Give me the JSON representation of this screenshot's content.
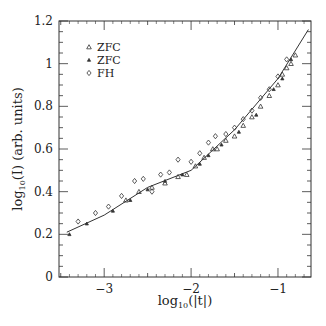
{
  "chart_data": {
    "type": "scatter",
    "title": "",
    "xlabel": "log10(|t|)",
    "ylabel": "log10(I) (arb. units)",
    "xlim": [
      -3.52,
      -0.62
    ],
    "ylim": [
      0,
      1.2
    ],
    "xticks": [
      -3,
      -2,
      -1
    ],
    "xtick_labels": [
      "−3",
      "−2",
      "−1"
    ],
    "yticks": [
      0,
      0.2,
      0.4,
      0.6,
      0.8,
      1.0,
      1.2
    ],
    "ytick_labels": [
      "0",
      "0.2",
      "0.4",
      "0.6",
      "0.8",
      "1",
      "1.2"
    ],
    "grid": false,
    "legend_position": "upper left",
    "legend": [
      {
        "label": "ZFC",
        "marker": "open-triangle"
      },
      {
        "label": "ZFC",
        "marker": "small-triangle"
      },
      {
        "label": "FH",
        "marker": "open-diamond"
      }
    ],
    "fit_line": {
      "x": [
        -3.43,
        -3.0,
        -2.5,
        -2.0,
        -1.5,
        -1.0,
        -0.65
      ],
      "y": [
        0.21,
        0.29,
        0.42,
        0.5,
        0.69,
        0.93,
        1.16
      ]
    },
    "series": [
      {
        "name": "ZFC (open triangles)",
        "x": [
          -2.75,
          -2.6,
          -2.45,
          -2.3,
          -2.15,
          -2.05,
          -1.95,
          -1.85,
          -1.75,
          -1.7,
          -1.6,
          -1.5,
          -1.4,
          -1.3,
          -1.2,
          -1.1,
          -1.0,
          -0.95,
          -0.9,
          -0.85,
          -0.8
        ],
        "y": [
          0.36,
          0.4,
          0.42,
          0.44,
          0.47,
          0.48,
          0.52,
          0.56,
          0.6,
          0.6,
          0.64,
          0.66,
          0.71,
          0.75,
          0.8,
          0.85,
          0.9,
          0.95,
          0.98,
          1.0,
          1.04
        ]
      },
      {
        "name": "ZFC (small triangles)",
        "x": [
          -3.4,
          -3.2,
          -2.9,
          -2.7,
          -2.5,
          -2.3,
          -2.1,
          -1.9,
          -1.8,
          -1.65,
          -1.45,
          -1.25,
          -1.05,
          -0.95,
          -0.85
        ],
        "y": [
          0.2,
          0.25,
          0.31,
          0.36,
          0.41,
          0.45,
          0.48,
          0.53,
          0.57,
          0.62,
          0.68,
          0.76,
          0.88,
          0.93,
          1.02
        ]
      },
      {
        "name": "FH",
        "x": [
          -3.3,
          -3.1,
          -2.95,
          -2.8,
          -2.65,
          -2.55,
          -2.45,
          -2.35,
          -2.25,
          -2.15,
          -2.0,
          -1.9,
          -1.8,
          -1.72,
          -1.6,
          -1.5,
          -1.4,
          -1.3,
          -1.2,
          -1.1,
          -1.0,
          -0.9
        ],
        "y": [
          0.26,
          0.3,
          0.33,
          0.38,
          0.45,
          0.46,
          0.4,
          0.48,
          0.49,
          0.55,
          0.54,
          0.58,
          0.63,
          0.66,
          0.67,
          0.7,
          0.74,
          0.78,
          0.84,
          0.88,
          0.94,
          1.02
        ]
      }
    ]
  }
}
